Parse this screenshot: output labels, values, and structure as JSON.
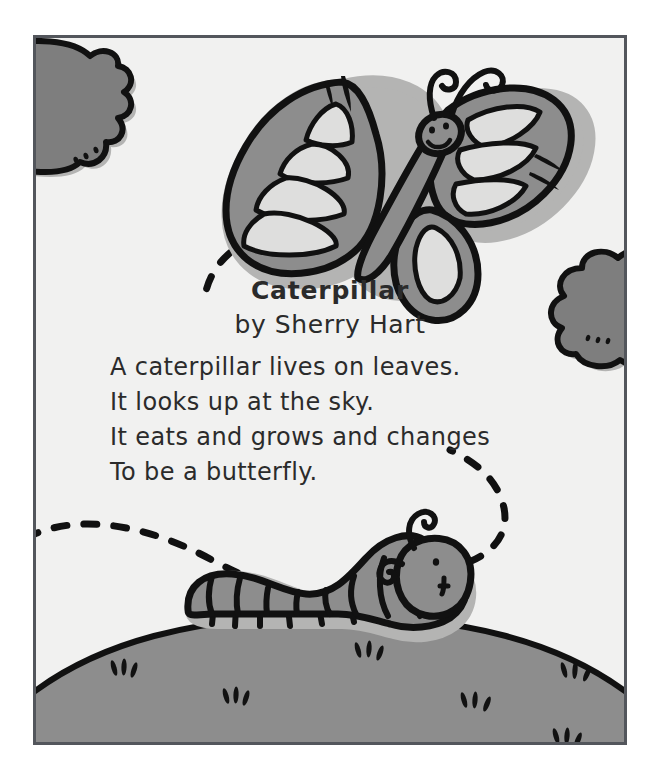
{
  "page": {
    "background_color": "#ffffff",
    "width": 661,
    "height": 780
  },
  "frame": {
    "border_color": "#53565c",
    "sky_color": "#f1f1f0"
  },
  "poem": {
    "title": "Caterpillar",
    "byline": "by Sherry Hart",
    "lines": [
      "A caterpillar lives on leaves.",
      "It looks up at the sky.",
      "It eats and grows and changes",
      "To be a butterfly."
    ],
    "text_color": "#2b2b2b"
  },
  "illustration": {
    "colors": {
      "ink": "#111111",
      "body_gray": "#8d8d8d",
      "dark_gray": "#777777",
      "light_gray": "#dededd",
      "shadow_gray": "#b4b4b3",
      "ground_gray": "#8d8d8d",
      "cloud_gray": "#7e7e7e"
    },
    "elements": [
      {
        "name": "cloud-top-left",
        "label": "cloud"
      },
      {
        "name": "cloud-right",
        "label": "cloud"
      },
      {
        "name": "butterfly",
        "label": "butterfly"
      },
      {
        "name": "caterpillar",
        "label": "caterpillar"
      },
      {
        "name": "flight-path",
        "label": "dashed flight trail"
      },
      {
        "name": "ground-hill",
        "label": "grassy hill"
      },
      {
        "name": "grass-tufts",
        "label": "grass tufts"
      },
      {
        "name": "motion-lines",
        "label": "motion lines"
      }
    ]
  }
}
